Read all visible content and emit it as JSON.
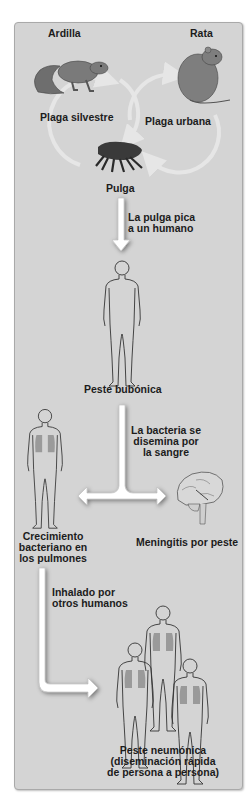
{
  "diagram": {
    "reservoirs": {
      "squirrel_label": "Ardilla",
      "rat_label": "Rata",
      "sylvatic_cycle_label": "Plaga silvestre",
      "urban_cycle_label": "Plaga urbana",
      "flea_label": "Pulga"
    },
    "steps": {
      "flea_bites": [
        "La pulga pica",
        "a un humano"
      ],
      "bubonic": "Peste bubónica",
      "blood_spread": [
        "La bacteria se",
        "disemina por",
        "la sangre"
      ],
      "lung_growth": [
        "Crecimiento",
        "bacteriano en",
        "los pulmones"
      ],
      "meningitis": "Meningitis por peste",
      "inhaled": [
        "Inhalado por",
        "otros humanos"
      ],
      "pneumonic": [
        "Peste neumónica",
        "(diseminación rápida",
        "de persona a persona)"
      ]
    },
    "colors": {
      "panel_bg": "#d4d4d4",
      "panel_border": "#a9a9a9",
      "arrow_fill": "#ffffff",
      "cycle_arrow": "#e6e6e6",
      "animal_fill": "#7a7a7a",
      "flea_fill": "#3a3a3a",
      "lung_fill": "#9a9a9a",
      "outline": "#333333"
    }
  }
}
